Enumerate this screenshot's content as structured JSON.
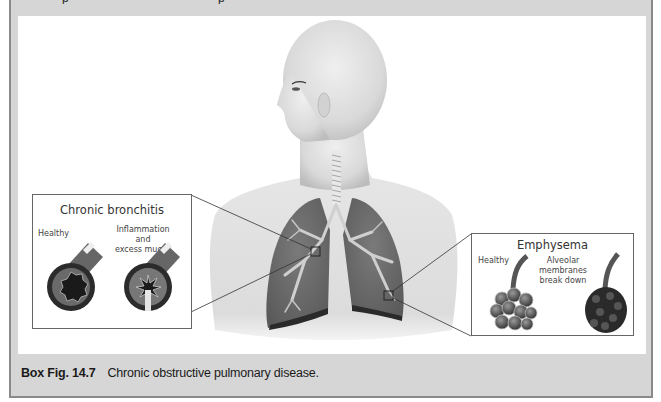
{
  "figure": {
    "top_text_fragment": "p",
    "body_illustration": "human-head-torso-with-lungs",
    "insets": {
      "chronic_bronchitis": {
        "title": "Chronic bronchitis",
        "labels": {
          "healthy": "Healthy",
          "diseased": "Inflammation and excess mucus",
          "diseased_line1": "Inflammation and",
          "diseased_line2": "excess mucus"
        }
      },
      "emphysema": {
        "title": "Emphysema",
        "labels": {
          "healthy": "Healthy",
          "diseased_line1": "Alveolar membranes",
          "diseased_line2": "break down"
        }
      }
    }
  },
  "caption": {
    "label": "Box Fig. 14.7",
    "text": "Chronic obstructive pulmonary disease."
  },
  "colors": {
    "frame_gray": "#d6d6d6",
    "frame_border": "#8a8a8a",
    "panel_white": "#ffffff",
    "lung": "#6f6f6f",
    "skin": "#e2e2e2"
  }
}
